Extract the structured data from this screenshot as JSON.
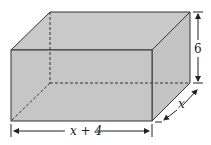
{
  "figure": {
    "type": "rectangular box (cuboid)",
    "fill_color": "#c8c8c8",
    "edge_color": "#333333",
    "labels": {
      "height": "6",
      "depth": "x",
      "width": "x + 4"
    }
  }
}
